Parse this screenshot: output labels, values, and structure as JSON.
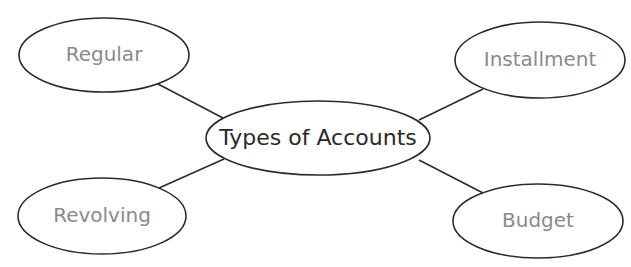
{
  "diagram": {
    "type": "concept-map",
    "center": {
      "label": "Types of Accounts",
      "cx": 318,
      "cy": 138,
      "rx": 112,
      "ry": 37,
      "text_color": "#2a2a2a",
      "font_size": 22
    },
    "nodes": [
      {
        "id": "regular",
        "label": "Regular",
        "cx": 104,
        "cy": 55,
        "rx": 85,
        "ry": 37,
        "line": [
          158,
          84,
          223,
          118
        ]
      },
      {
        "id": "installment",
        "label": "Installment",
        "cx": 540,
        "cy": 60,
        "rx": 85,
        "ry": 38,
        "line": [
          483,
          89,
          419,
          120
        ]
      },
      {
        "id": "revolving",
        "label": "Revolving",
        "cx": 102,
        "cy": 216,
        "rx": 84,
        "ry": 38,
        "line": [
          159,
          188,
          224,
          159
        ]
      },
      {
        "id": "budget",
        "label": "Budget",
        "cx": 538,
        "cy": 221,
        "rx": 85,
        "ry": 37,
        "line": [
          419,
          160,
          483,
          193
        ]
      }
    ],
    "colors": {
      "stroke": "#2b2b2b",
      "node_text": "#8a8a8a",
      "background": "#ffffff"
    }
  }
}
